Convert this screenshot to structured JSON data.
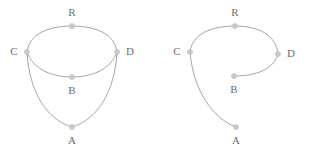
{
  "page": {
    "background_color": "#ffffff",
    "width": 311,
    "height": 157
  },
  "style": {
    "edge_color": "#9b9b9b",
    "node_fill_color": "#c9c9c9",
    "node_stroke_color": "#bdbdbd",
    "label_color": "#6e6e6e",
    "edge_width": 0.9,
    "node_radius": 2.6,
    "label_font_size": 11
  },
  "figures": [
    {
      "id": "left-figure",
      "name": "complete-graph-figure",
      "nodes": [
        {
          "id": "R",
          "label": "R",
          "x": 72,
          "y": 26,
          "label_x": 72,
          "label_y": 13
        },
        {
          "id": "C",
          "label": "C",
          "x": 27,
          "y": 52,
          "label_x": 14,
          "label_y": 52
        },
        {
          "id": "D",
          "label": "D",
          "x": 117,
          "y": 52,
          "label_x": 130,
          "label_y": 52
        },
        {
          "id": "B",
          "label": "B",
          "x": 72,
          "y": 77,
          "label_x": 72,
          "label_y": 91
        },
        {
          "id": "A",
          "label": "A",
          "x": 72,
          "y": 127,
          "label_x": 72,
          "label_y": 141
        }
      ],
      "edges": [
        {
          "id": "L-C-R",
          "from": "C",
          "to": "R",
          "path": "M 27 52 C 29 34 48 26 72 26"
        },
        {
          "id": "L-R-D",
          "from": "R",
          "to": "D",
          "path": "M 72 26 C 96 26 115 34 117 52"
        },
        {
          "id": "L-C-B",
          "from": "C",
          "to": "B",
          "path": "M 27 52 C 33 69 51 77 72 77"
        },
        {
          "id": "L-D-B",
          "from": "D",
          "to": "B",
          "path": "M 117 52 C 111 69 93 77 72 77"
        },
        {
          "id": "L-C-A",
          "from": "C",
          "to": "A",
          "path": "M 27 52 C 29 92 47 120 72 127"
        },
        {
          "id": "L-D-A",
          "from": "D",
          "to": "A",
          "path": "M 117 52 C 115 92 97 120 72 127"
        }
      ]
    },
    {
      "id": "right-figure",
      "name": "partial-graph-figure",
      "nodes": [
        {
          "id": "R",
          "label": "R",
          "x": 235,
          "y": 26,
          "label_x": 235,
          "label_y": 13
        },
        {
          "id": "C",
          "label": "C",
          "x": 190,
          "y": 52,
          "label_x": 177,
          "label_y": 52
        },
        {
          "id": "D",
          "label": "D",
          "x": 278,
          "y": 54,
          "label_x": 291,
          "label_y": 54
        },
        {
          "id": "B",
          "label": "B",
          "x": 234,
          "y": 76,
          "label_x": 234,
          "label_y": 90
        },
        {
          "id": "A",
          "label": "A",
          "x": 236,
          "y": 127,
          "label_x": 236,
          "label_y": 141
        }
      ],
      "edges": [
        {
          "id": "R-C-R",
          "from": "C",
          "to": "R",
          "path": "M 190 52 C 192 34 211 26 235 26"
        },
        {
          "id": "R-R-D",
          "from": "R",
          "to": "D",
          "path": "M 235 26 C 259 26 276 35 278 54"
        },
        {
          "id": "R-D-B",
          "from": "D",
          "to": "B",
          "path": "M 278 54 C 274 69 257 76 234 76"
        },
        {
          "id": "R-C-A",
          "from": "C",
          "to": "A",
          "path": "M 190 52 C 193 90 213 119 236 127"
        }
      ]
    }
  ]
}
